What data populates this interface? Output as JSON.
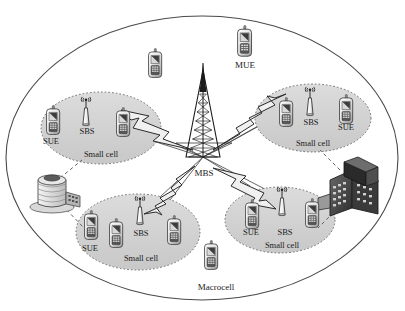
{
  "diagram": {
    "macrocell_label": "Macrocell",
    "mbs_label": "MBS",
    "mue_label": "MUE",
    "small_cell_label": "Small cell",
    "sbs_label": "SBS",
    "sue_label": "SUE",
    "colors": {
      "small_cell_fill": "#d4d4d4",
      "small_cell_border": "#6b6b6b",
      "macrocell_border": "#4a4a4a",
      "link_line": "#3a3a3a",
      "text": "#1a1a1a",
      "building_dark": "#4a4a4a",
      "building_light": "#cfcfcf",
      "page_background": "#ffffff"
    },
    "macrocell": {
      "cx": 202,
      "cy": 158,
      "rx": 196,
      "ry": 142
    },
    "mbs": {
      "x": 203,
      "y": 157,
      "label_x": 203,
      "label_y": 176,
      "icon": "lattice-tower-icon"
    },
    "small_cells": [
      {
        "id": "small-cell-top-left",
        "cx": 101,
        "cy": 128,
        "rx": 60,
        "ry": 36,
        "label_x": 101,
        "label_y": 159,
        "sbs": {
          "x": 86,
          "y": 113,
          "label_x": 86,
          "label_y": 133
        },
        "devices": [
          {
            "name": "sue-phone",
            "x": 51,
            "y": 119,
            "label": "SUE",
            "label_x": 51,
            "label_y": 142
          },
          {
            "name": "sue-phone-unlabeled",
            "x": 122,
            "y": 122,
            "label": "",
            "label_x": 0,
            "label_y": 0
          }
        ]
      },
      {
        "id": "small-cell-top-right",
        "cx": 313,
        "cy": 118,
        "rx": 58,
        "ry": 34,
        "label_x": 313,
        "label_y": 148,
        "sbs": {
          "x": 310,
          "y": 103,
          "label_x": 310,
          "label_y": 124
        },
        "devices": [
          {
            "name": "sue-phone-unlabeled",
            "x": 283,
            "y": 110,
            "label": "",
            "label_x": 0,
            "label_y": 0
          },
          {
            "name": "sue-phone",
            "x": 345,
            "y": 109,
            "label": "SUE",
            "label_x": 345,
            "label_y": 128
          }
        ]
      },
      {
        "id": "small-cell-bottom-left",
        "cx": 138,
        "cy": 232,
        "rx": 62,
        "ry": 38,
        "label_x": 140,
        "label_y": 260,
        "sbs": {
          "x": 140,
          "y": 212,
          "label_x": 140,
          "label_y": 234
        },
        "devices": [
          {
            "name": "sue-phone",
            "x": 90,
            "y": 225,
            "label": "SUE",
            "label_x": 89,
            "label_y": 249
          },
          {
            "name": "sue-phone-unlabeled",
            "x": 116,
            "y": 233,
            "label": "",
            "label_x": 0,
            "label_y": 0
          },
          {
            "name": "sue-phone-unlabeled-2",
            "x": 174,
            "y": 230,
            "label": "",
            "label_x": 0,
            "label_y": 0
          }
        ]
      },
      {
        "id": "small-cell-bottom-right",
        "cx": 280,
        "cy": 220,
        "rx": 55,
        "ry": 33,
        "label_x": 281,
        "label_y": 245,
        "sbs": {
          "x": 282,
          "y": 202,
          "label_x": 284,
          "label_y": 233
        },
        "devices": [
          {
            "name": "sue-phone",
            "x": 250,
            "y": 214,
            "label": "SUE",
            "label_x": 250,
            "label_y": 233
          },
          {
            "name": "sue-phone-unlabeled",
            "x": 311,
            "y": 213,
            "label": "",
            "label_x": 0,
            "label_y": 0
          }
        ]
      }
    ],
    "macro_users": [
      {
        "name": "mue-phone-labeled",
        "x": 244,
        "y": 40,
        "label": "MUE",
        "label_x": 245,
        "label_y": 63
      },
      {
        "name": "mue-phone-top",
        "x": 154,
        "y": 63,
        "label": "",
        "label_x": 0,
        "label_y": 0
      },
      {
        "name": "mue-phone-bottom",
        "x": 211,
        "y": 253,
        "label": "",
        "label_x": 0,
        "label_y": 0
      }
    ],
    "buildings": [
      {
        "name": "building-left-tower",
        "x": 52,
        "y": 190,
        "style": "light"
      },
      {
        "name": "building-right-block",
        "x": 352,
        "y": 190,
        "style": "dark"
      }
    ],
    "backhaul_links": [
      {
        "from": "small-cell-top-left",
        "to": "mbs"
      },
      {
        "from": "small-cell-top-right",
        "to": "mbs"
      },
      {
        "from": "small-cell-bottom-left",
        "to": "mbs"
      },
      {
        "from": "small-cell-bottom-right",
        "to": "mbs"
      }
    ]
  }
}
